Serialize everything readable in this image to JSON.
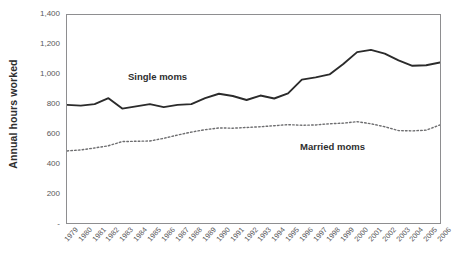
{
  "chart": {
    "y_axis_title": "Annual hours worked",
    "y_tick_labels": [
      "1,400",
      "1,200",
      "1,000",
      "800",
      "600",
      "400",
      "200",
      "-"
    ],
    "series_labels": {
      "single": "Single moms",
      "married": "Married moms"
    }
  },
  "chart_data": {
    "type": "line",
    "title": "",
    "xlabel": "",
    "ylabel": "Annual hours worked",
    "ylim": [
      0,
      1400
    ],
    "yticks": [
      0,
      200,
      400,
      600,
      800,
      1000,
      1200,
      1400
    ],
    "ytick_labels": [
      "-",
      "200",
      "400",
      "600",
      "800",
      "1,000",
      "1,200",
      "1,400"
    ],
    "grid": false,
    "legend": "inline-annotations",
    "x": [
      "1979",
      "1980",
      "1981",
      "1982",
      "1983",
      "1984",
      "1985",
      "1986",
      "1987",
      "1988",
      "1989",
      "1990",
      "1991",
      "1992",
      "1993",
      "1994",
      "1995",
      "1996",
      "1997",
      "1998",
      "1999",
      "2000",
      "2001",
      "2002",
      "2003",
      "2004",
      "2005",
      "2006"
    ],
    "series": [
      {
        "name": "Single moms",
        "style": "solid",
        "color": "#2b2b2b",
        "values": [
          795,
          790,
          800,
          840,
          770,
          785,
          800,
          780,
          795,
          800,
          840,
          870,
          855,
          828,
          858,
          838,
          872,
          965,
          980,
          1000,
          1070,
          1150,
          1165,
          1140,
          1095,
          1058,
          1062,
          1080
        ]
      },
      {
        "name": "Married moms",
        "style": "dotted",
        "color": "#6e6e70",
        "values": [
          485,
          492,
          505,
          520,
          548,
          550,
          552,
          570,
          592,
          612,
          628,
          640,
          638,
          643,
          648,
          655,
          662,
          658,
          660,
          668,
          672,
          682,
          668,
          648,
          622,
          620,
          625,
          660
        ]
      }
    ]
  }
}
